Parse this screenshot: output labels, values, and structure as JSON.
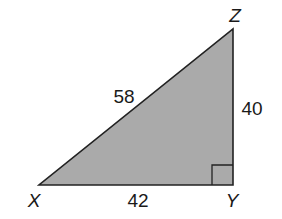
{
  "diagram": {
    "type": "right-triangle",
    "fill_color": "#aaaaaa",
    "stroke_color": "#222222",
    "vertices": {
      "X": {
        "label": "X",
        "x": 39,
        "y": 185
      },
      "Y": {
        "label": "Y",
        "x": 233,
        "y": 185
      },
      "Z": {
        "label": "Z",
        "x": 233,
        "y": 29
      }
    },
    "right_angle_at": "Y",
    "sides": {
      "XZ": {
        "label": "58"
      },
      "ZY": {
        "label": "40"
      },
      "XY": {
        "label": "42"
      }
    }
  }
}
